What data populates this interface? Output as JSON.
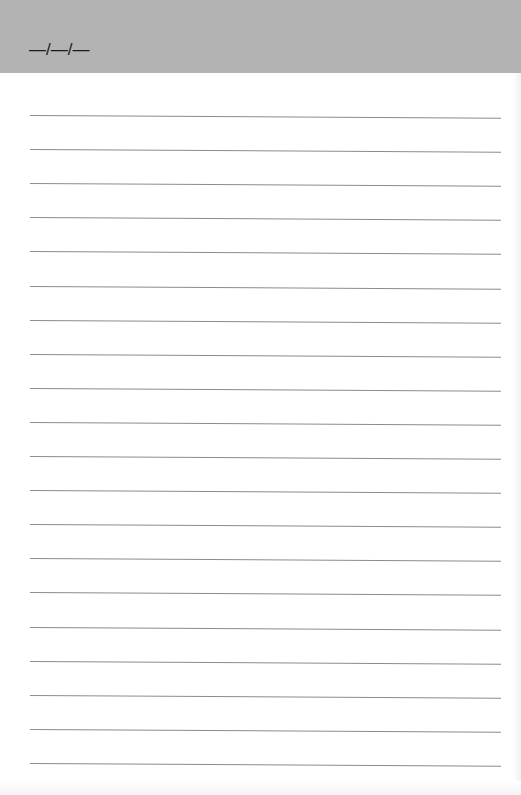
{
  "header": {
    "date_placeholder": "—/—/—",
    "background_color": "#b3b3b3"
  },
  "page": {
    "rule_count": 20,
    "rule_color": "#8c8c8c",
    "first_rule_y": 115,
    "rule_spacing": 34.1
  }
}
